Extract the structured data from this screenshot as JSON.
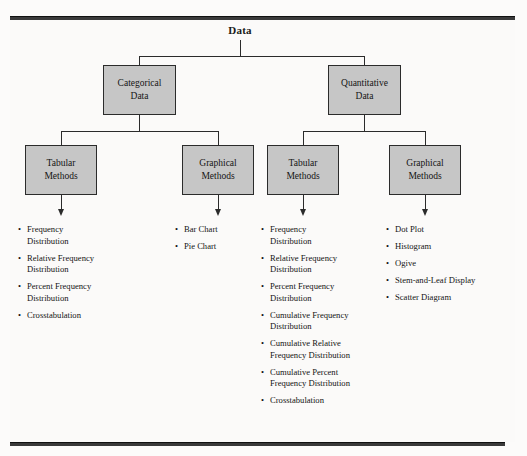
{
  "diagram": {
    "root": {
      "label": "Data"
    },
    "level1": [
      {
        "name": "categorical-data",
        "lines": [
          "Categorical",
          "Data"
        ]
      },
      {
        "name": "quantitative-data",
        "lines": [
          "Quantitative",
          "Data"
        ]
      }
    ],
    "level2": [
      {
        "name": "categorical-tabular-methods",
        "lines": [
          "Tabular",
          "Methods"
        ]
      },
      {
        "name": "categorical-graphical-methods",
        "lines": [
          "Graphical",
          "Methods"
        ]
      },
      {
        "name": "quantitative-tabular-methods",
        "lines": [
          "Tabular",
          "Methods"
        ]
      },
      {
        "name": "quantitative-graphical-methods",
        "lines": [
          "Graphical",
          "Methods"
        ]
      }
    ],
    "bullet_marker": "•",
    "lists": {
      "categorical_tabular": [
        [
          "Frequency",
          "Distribution"
        ],
        [
          "Relative Frequency",
          "Distribution"
        ],
        [
          "Percent Frequency",
          "Distribution"
        ],
        [
          "Crosstabulation"
        ]
      ],
      "categorical_graphical": [
        [
          "Bar Chart"
        ],
        [
          "Pie Chart"
        ]
      ],
      "quantitative_tabular": [
        [
          "Frequency",
          "Distribution"
        ],
        [
          "Relative Frequency",
          "Distribution"
        ],
        [
          "Percent Frequency",
          "Distribution"
        ],
        [
          "Cumulative Frequency",
          "Distribution"
        ],
        [
          "Cumulative Relative",
          "Frequency Distribution"
        ],
        [
          "Cumulative Percent",
          "Frequency Distribution"
        ],
        [
          "Crosstabulation"
        ]
      ],
      "quantitative_graphical": [
        [
          "Dot Plot"
        ],
        [
          "Histogram"
        ],
        [
          "Ogive"
        ],
        [
          "Stem-and-Leaf Display"
        ],
        [
          "Scatter Diagram"
        ]
      ]
    },
    "colors": {
      "box_fill": "#c6c6c6",
      "box_border": "#2b2b2b",
      "rule": "#3a3a3a",
      "page": "#fbfaf9",
      "text": "#141414"
    }
  }
}
